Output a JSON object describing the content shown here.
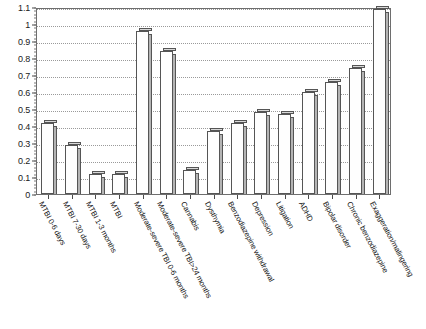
{
  "chart_data": {
    "type": "bar",
    "title": "",
    "subtitle": "",
    "xlabel": "",
    "ylabel": "",
    "ylim": [
      0,
      1.1
    ],
    "ytick_step": 0.1,
    "grid": true,
    "legend": "none",
    "orientation": "vertical",
    "bar_style": "3d-outline",
    "categories": [
      "MTBI 0-6 days",
      "MTBI 7-30 days",
      "MTBI 1-3 months",
      "MTBI",
      "Moderate-severe TBI 0-6 months",
      "Moderate-severe TBI>24 months",
      "Cannabis",
      "Dysthymia",
      "Benzodiazepine withdrawal",
      "Depression",
      "Litigation",
      "ADHD",
      "Bipolar disorder",
      "Chronic benzodiazepine",
      "Exaggeration/malingering"
    ],
    "values": [
      0.42,
      0.29,
      0.12,
      0.12,
      0.96,
      0.84,
      0.14,
      0.37,
      0.42,
      0.48,
      0.47,
      0.6,
      0.66,
      0.74,
      1.09
    ],
    "ytick_labels": [
      "0",
      "0.1",
      "0.2",
      "0.3",
      "0.4",
      "0.5",
      "0.6",
      "0.7",
      "0.8",
      "0.9",
      "1",
      "1.1"
    ],
    "ytick_values": [
      0,
      0.1,
      0.2,
      0.3,
      0.4,
      0.5,
      0.6,
      0.7,
      0.8,
      0.9,
      1,
      1.1
    ],
    "colors": {
      "bar_face": "#fefefe",
      "bar_edge": "#555555",
      "bar_side": "#b4b4b4",
      "bar_top": "#d8d8d8",
      "grid": "#9a9a9a",
      "frame": "#6e6e6e",
      "text": "#141414",
      "background": "#ffffff"
    }
  }
}
